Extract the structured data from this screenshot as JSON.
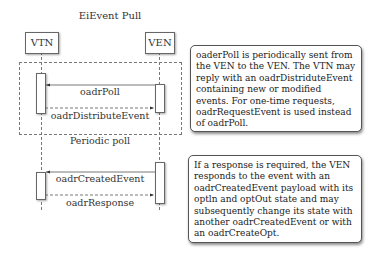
{
  "diagram": {
    "title": "EiEvent Pull",
    "actors": [
      {
        "id": "vtn",
        "label": "VTN"
      },
      {
        "id": "ven",
        "label": "VEN"
      }
    ],
    "frame_label": "Periodic poll",
    "messages": [
      {
        "label": "oadrPoll",
        "from": "VEN",
        "to": "VTN",
        "style": "solid"
      },
      {
        "label": "oadrDistributeEvent",
        "from": "VTN",
        "to": "VEN",
        "style": "dashed"
      },
      {
        "label": "oadrCreatedEvent",
        "from": "VEN",
        "to": "VTN",
        "style": "solid"
      },
      {
        "label": "oadrResponse",
        "from": "VTN",
        "to": "VEN",
        "style": "dashed"
      }
    ],
    "notes": [
      {
        "text": "oaderPoll is periodically sent from the VEN to the VEN. The VTN may reply with an oadrDistriduteEvent containing new or modified events. For one-time requests, oadrRequestEvent is used instead of oadrPoll."
      },
      {
        "text": "If a response is required, the VEN responds to the event with an oadrCreatedEvent payload with its optln and optOut state and may subsequently change its state with another oadrCreatedEvent or with an oadrCreateOpt."
      }
    ]
  }
}
